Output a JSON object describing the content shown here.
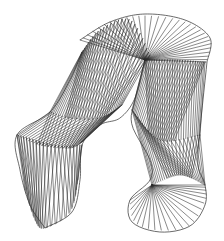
{
  "artwork": {
    "title": "",
    "description": "String-art wireframe of a two-legged ruled surface",
    "background": "#ffffff",
    "stroke": "#2b2b2b",
    "stroke_width": 0.55,
    "hub": [
      145,
      60
    ],
    "sections": [
      {
        "name": "top-rim-fan",
        "a": [
          [
            145,
            60
          ],
          [
            145,
            60
          ],
          [
            145,
            60
          ],
          [
            145,
            60
          ],
          [
            145,
            60
          ]
        ],
        "b": [
          [
            80,
            40
          ],
          [
            110,
            22
          ],
          [
            145,
            16
          ],
          [
            185,
            22
          ],
          [
            210,
            40
          ],
          [
            206,
            62
          ]
        ],
        "count": 30
      },
      {
        "name": "left-upper-thigh",
        "a": [
          [
            82,
            52
          ],
          [
            100,
            30
          ],
          [
            130,
            20
          ],
          [
            150,
            55
          ]
        ],
        "b": [
          [
            50,
            112
          ],
          [
            70,
            118
          ],
          [
            100,
            118
          ],
          [
            122,
            105
          ]
        ],
        "count": 26,
        "twist": 0.45
      },
      {
        "name": "left-lower-shin",
        "a": [
          [
            50,
            112
          ],
          [
            70,
            118
          ],
          [
            100,
            118
          ],
          [
            122,
            105
          ]
        ],
        "b": [
          [
            17,
            135
          ],
          [
            40,
            145
          ],
          [
            70,
            148
          ],
          [
            82,
            142
          ]
        ],
        "count": 22,
        "twist": 0.5
      },
      {
        "name": "left-foot",
        "a": [
          [
            17,
            135
          ],
          [
            35,
            140
          ],
          [
            60,
            146
          ],
          [
            82,
            145
          ]
        ],
        "b": [
          [
            25,
            190
          ],
          [
            35,
            220
          ],
          [
            45,
            228
          ],
          [
            70,
            212
          ],
          [
            78,
            180
          ]
        ],
        "count": 20,
        "twist": 0.2
      },
      {
        "name": "right-upper-thigh",
        "a": [
          [
            145,
            60
          ],
          [
            175,
            60
          ],
          [
            205,
            62
          ]
        ],
        "b": [
          [
            132,
            110
          ],
          [
            160,
            140
          ],
          [
            200,
            135
          ]
        ],
        "count": 26,
        "twist": 0.55
      },
      {
        "name": "right-lower-shin",
        "a": [
          [
            132,
            110
          ],
          [
            160,
            140
          ],
          [
            200,
            135
          ]
        ],
        "b": [
          [
            152,
            185
          ],
          [
            180,
            175
          ],
          [
            205,
            185
          ]
        ],
        "count": 22,
        "twist": 0.5
      },
      {
        "name": "right-foot-fan",
        "a": [
          [
            152,
            185
          ],
          [
            152,
            185
          ],
          [
            152,
            185
          ]
        ],
        "b": [
          [
            130,
            200
          ],
          [
            135,
            222
          ],
          [
            160,
            230
          ],
          [
            190,
            225
          ],
          [
            205,
            200
          ],
          [
            205,
            185
          ]
        ],
        "count": 22
      }
    ],
    "outlines": [
      [
        [
          80,
          40
        ],
        [
          110,
          22
        ],
        [
          145,
          14
        ],
        [
          185,
          20
        ],
        [
          210,
          38
        ],
        [
          207,
          62
        ]
      ],
      [
        [
          82,
          52
        ],
        [
          70,
          80
        ],
        [
          50,
          112
        ],
        [
          17,
          135
        ],
        [
          20,
          170
        ],
        [
          30,
          205
        ],
        [
          45,
          228
        ]
      ],
      [
        [
          45,
          228
        ],
        [
          72,
          212
        ],
        [
          80,
          180
        ],
        [
          82,
          145
        ],
        [
          100,
          125
        ],
        [
          120,
          118
        ],
        [
          135,
          98
        ],
        [
          145,
          60
        ]
      ],
      [
        [
          145,
          60
        ],
        [
          135,
          100
        ],
        [
          132,
          125
        ],
        [
          150,
          160
        ],
        [
          150,
          180
        ],
        [
          130,
          200
        ],
        [
          132,
          222
        ],
        [
          160,
          232
        ],
        [
          190,
          226
        ],
        [
          205,
          205
        ],
        [
          205,
          185
        ],
        [
          198,
          165
        ],
        [
          200,
          130
        ],
        [
          207,
          62
        ]
      ]
    ]
  }
}
